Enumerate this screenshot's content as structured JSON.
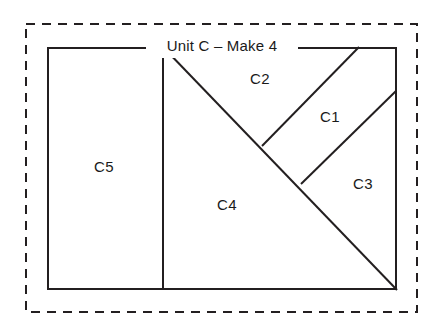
{
  "diagram": {
    "title": "Unit C – Make 4",
    "background_color": "#ffffff",
    "line_color": "#231f20",
    "dashed_border_color": "#231f20",
    "text_color": "#1a1a1a",
    "outer_dashed_frame": {
      "x": 25,
      "y": 23,
      "width": 393,
      "height": 290,
      "dash_pattern": "9 7",
      "stroke_width": 2
    },
    "block_rect": {
      "x": 47,
      "y": 47,
      "width": 350,
      "height": 243,
      "stroke_width": 2
    },
    "seam_lines": [
      {
        "name": "vertical-divider",
        "x1": 163,
        "y1": 47,
        "x2": 163,
        "y2": 290
      },
      {
        "name": "main-diagonal",
        "x1": 163,
        "y1": 47,
        "x2": 397,
        "y2": 290
      },
      {
        "name": "upper-right-diagonal",
        "x1": 359,
        "y1": 47,
        "x2": 262,
        "y2": 146
      },
      {
        "name": "lower-right-diagonal",
        "x1": 396,
        "y1": 91,
        "x2": 301,
        "y2": 184
      }
    ],
    "pieces": [
      {
        "id": "c1",
        "label": "C1",
        "x": 330,
        "y": 118
      },
      {
        "id": "c2",
        "label": "C2",
        "x": 260,
        "y": 80
      },
      {
        "id": "c3",
        "label": "C3",
        "x": 363,
        "y": 185
      },
      {
        "id": "c4",
        "label": "C4",
        "x": 227,
        "y": 206
      },
      {
        "id": "c5",
        "label": "C5",
        "x": 104,
        "y": 168
      }
    ],
    "title_position": {
      "x": 222,
      "y": 47
    }
  }
}
